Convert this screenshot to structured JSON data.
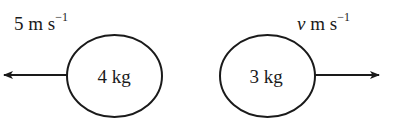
{
  "diagram": {
    "type": "collision-momentum",
    "colors": {
      "stroke": "#1a1a1a",
      "background": "#ffffff"
    },
    "left_body": {
      "mass_label": "4 kg",
      "velocity": {
        "value": "5",
        "unit": "m s",
        "exponent": "−1",
        "direction": "left"
      }
    },
    "right_body": {
      "mass_label": "3 kg",
      "velocity": {
        "value": "v",
        "unit": "m s",
        "exponent": "−1",
        "direction": "right"
      }
    }
  }
}
